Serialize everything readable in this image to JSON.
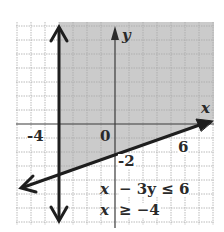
{
  "diagram": {
    "type": "system-of-linear-inequalities-graph",
    "inequalities": [
      "x - 3y ≤ 6",
      "x ≥ -4"
    ],
    "axes": {
      "x_label": "x",
      "y_label": "y",
      "origin_label": "0",
      "tick_labels": {
        "x_neg4": "-4",
        "x_6": "6",
        "y_neg2": "-2"
      }
    },
    "boundaries": [
      {
        "equation": "x - 3y = 6",
        "style": "solid",
        "slope": 0.3333,
        "y_intercept": -2
      },
      {
        "equation": "x = -4",
        "style": "solid"
      }
    ],
    "shaded_region": "x ≥ -4 and above x - 3y = 6",
    "colors": {
      "shade": "#c8c8c8",
      "grid": "#b0b0b0",
      "axis": "#3a3a3a",
      "line": "#1e1e1e"
    }
  },
  "labels": {
    "ineq1_left": "x",
    "ineq1_right": "− 3y ≤ 6",
    "ineq2_left": "x",
    "ineq2_right": "≥ −4"
  }
}
